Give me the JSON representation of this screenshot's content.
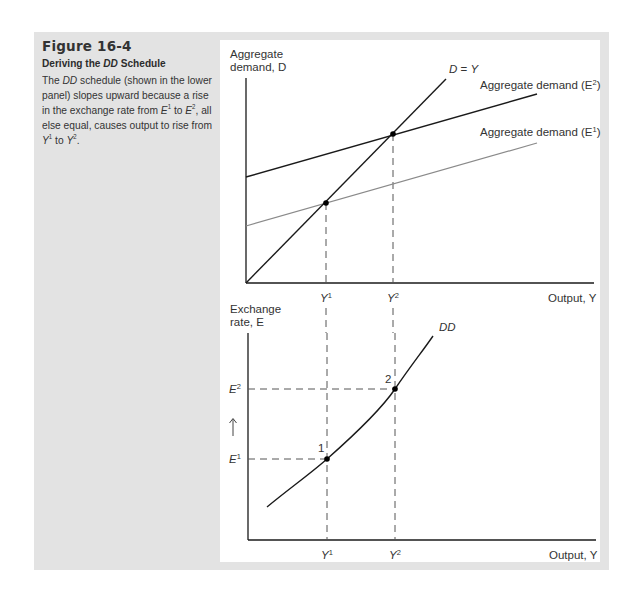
{
  "caption": {
    "figure_number": "Figure 16-4",
    "title_prefix": "Deriving the ",
    "title_italic": "DD",
    "title_suffix": " Schedule",
    "body": [
      {
        "t": "The "
      },
      {
        "t": "DD",
        "i": true
      },
      {
        "t": " schedule (shown in the lower panel) slopes upward because a rise in the exchange rate from "
      },
      {
        "t": "E",
        "i": true
      },
      {
        "t": "1",
        "sup": true
      },
      {
        "t": " to "
      },
      {
        "t": "E",
        "i": true
      },
      {
        "t": "2",
        "sup": true
      },
      {
        "t": ", all else equal, causes output to rise from "
      },
      {
        "t": "Y",
        "i": true
      },
      {
        "t": "1",
        "sup": true
      },
      {
        "t": " to "
      },
      {
        "t": "Y",
        "i": true
      },
      {
        "t": "2",
        "sup": true
      },
      {
        "t": "."
      }
    ]
  },
  "colors": {
    "panel_bg": "#e3e3e3",
    "chart_bg": "#ffffff",
    "axis": "#1a1a1a",
    "ad_e2_line": "#1a1a1a",
    "ad_e1_line": "#8a8a8a",
    "dashed": "#555555"
  },
  "chart_data": [
    {
      "type": "line",
      "title": "Aggregate demand vs output (upper panel)",
      "ylabel": "Aggregate demand, D",
      "ylabel_line1": "Aggregate",
      "ylabel_line2_prefix": "demand, ",
      "ylabel_var": "D",
      "xlabel": "Output, Y",
      "xlabel_prefix": "Output, ",
      "xlabel_var": "Y",
      "xticks": [
        "Y1",
        "Y2"
      ],
      "grid": false,
      "series": [
        {
          "name": "D = Y",
          "label_prefix": "D",
          "label_mid": " = ",
          "label_suffix": "Y",
          "style": "45-degree line",
          "points": [
            [
              0,
              0
            ],
            [
              1,
              1
            ],
            [
              2,
              2
            ],
            [
              2.7,
              2.7
            ]
          ]
        },
        {
          "name": "Aggregate demand (E2)",
          "label": "Aggregate demand (",
          "label_var": "E",
          "label_sup": "2",
          "style": "solid dark",
          "points": [
            [
              0,
              1.3
            ],
            [
              2,
              2
            ],
            [
              3.9,
              2.65
            ]
          ]
        },
        {
          "name": "Aggregate demand (E1)",
          "label": "Aggregate demand (",
          "label_var": "E",
          "label_sup": "1",
          "style": "solid gray",
          "points": [
            [
              0,
              0.7
            ],
            [
              1,
              1
            ],
            [
              3.9,
              1.75
            ]
          ]
        }
      ],
      "equilibria": [
        {
          "at": "Y1",
          "x": 1,
          "y": 1
        },
        {
          "at": "Y2",
          "x": 2,
          "y": 2
        }
      ]
    },
    {
      "type": "line",
      "title": "DD schedule (lower panel)",
      "ylabel": "Exchange rate, E",
      "ylabel_line1": "Exchange",
      "ylabel_line2_prefix": "rate, ",
      "ylabel_var": "E",
      "xlabel": "Output, Y",
      "xlabel_prefix": "Output, ",
      "xlabel_var": "Y",
      "xticks": [
        "Y1",
        "Y2"
      ],
      "yticks": [
        "E1",
        "E2"
      ],
      "arrow": "upward arrow between E1 and E2",
      "grid": false,
      "series": [
        {
          "name": "DD",
          "label": "DD",
          "style": "upward-sloping convex curve",
          "points": [
            [
              0.25,
              0.45
            ],
            [
              1,
              1
            ],
            [
              2,
              2
            ],
            [
              2.5,
              2.9
            ]
          ]
        }
      ],
      "points": [
        {
          "label": "1",
          "x": "Y1",
          "y": "E1"
        },
        {
          "label": "2",
          "x": "Y2",
          "y": "E2"
        }
      ]
    }
  ],
  "labels": {
    "y1": "Y",
    "y1_sup": "1",
    "y2": "Y",
    "y2_sup": "2",
    "e1": "E",
    "e1_sup": "1",
    "e2": "E",
    "e2_sup": "2",
    "point1": "1",
    "point2": "2",
    "up_arrow": "↑",
    "dd": "DD"
  }
}
